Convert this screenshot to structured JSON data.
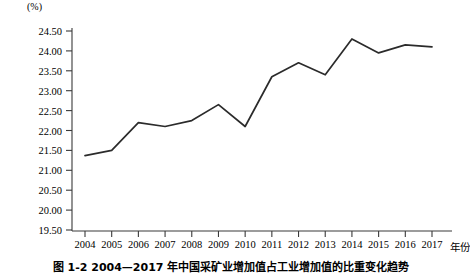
{
  "figure": {
    "unit_label": "(%)",
    "caption": "图 1-2  2004—2017 年中国采矿业增加值占工业增加值的比重变化趋势"
  },
  "chart_data": {
    "type": "line",
    "title": "",
    "subtitle": "",
    "xlabel": "年份",
    "ylabel": "(%)",
    "grid": false,
    "legend": "none",
    "xlim": [
      "2004",
      "2017"
    ],
    "ylim": [
      19.5,
      24.5
    ],
    "ytick_step": 0.5,
    "line_color": "#2b2b2b",
    "categories": [
      "2004",
      "2005",
      "2006",
      "2007",
      "2008",
      "2009",
      "2010",
      "2011",
      "2012",
      "2013",
      "2014",
      "2015",
      "2016",
      "2017"
    ],
    "ytick_labels": [
      "24.50",
      "24.00",
      "23.50",
      "23.00",
      "22.50",
      "22.00",
      "21.50",
      "21.00",
      "20.50",
      "20.00",
      "19.50"
    ],
    "series": [
      {
        "name": "采矿业增加值占比",
        "values": [
          21.37,
          21.5,
          22.2,
          22.1,
          22.25,
          22.65,
          22.1,
          23.35,
          23.7,
          23.4,
          24.3,
          23.95,
          24.15,
          24.1
        ]
      }
    ]
  }
}
